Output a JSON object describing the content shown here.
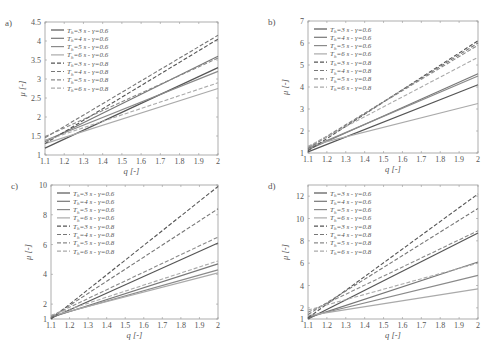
{
  "chart_data": [
    {
      "panel": "a)",
      "type": "line",
      "xlabel": "q [-]",
      "ylabel": "μ [-]",
      "xlim": [
        1.1,
        2
      ],
      "ylim": [
        1,
        4.5
      ],
      "xticks": [
        "1.1",
        "1.2",
        "1.3",
        "1.4",
        "1.5",
        "1.6",
        "1.7",
        "1.8",
        "1.9",
        "2"
      ],
      "yticks": [
        "1",
        "1.5",
        "2",
        "2.5",
        "3",
        "3.5",
        "4",
        "4.5"
      ],
      "legend_position": "upper left",
      "series": [
        {
          "name": "T_h=3 s - γ=0.6",
          "style": "solid",
          "color": "#555555",
          "x": [
            1.1,
            2
          ],
          "values": [
            1.18,
            3.3
          ]
        },
        {
          "name": "T_h=4 s - γ=0.6",
          "style": "solid",
          "color": "#777777",
          "x": [
            1.1,
            2
          ],
          "values": [
            1.35,
            3.6
          ]
        },
        {
          "name": "T_h=5 s - γ=0.6",
          "style": "solid",
          "color": "#8a8a8a",
          "x": [
            1.1,
            2
          ],
          "values": [
            1.38,
            3.2
          ]
        },
        {
          "name": "T_h=6 s - γ=0.6",
          "style": "solid",
          "color": "#aaaaaa",
          "x": [
            1.1,
            2
          ],
          "values": [
            1.3,
            2.75
          ]
        },
        {
          "name": "T_h=3 s - γ=0.8",
          "style": "dashed",
          "color": "#555555",
          "x": [
            1.1,
            2
          ],
          "values": [
            1.3,
            4.05
          ]
        },
        {
          "name": "T_h=4 s - γ=0.8",
          "style": "dashed",
          "color": "#777777",
          "x": [
            1.1,
            2
          ],
          "values": [
            1.45,
            4.15
          ]
        },
        {
          "name": "T_h=5 s - γ=0.8",
          "style": "dashed",
          "color": "#8a8a8a",
          "x": [
            1.1,
            2
          ],
          "values": [
            1.48,
            3.55
          ]
        },
        {
          "name": "T_h=6 s - γ=0.8",
          "style": "dashed",
          "color": "#aaaaaa",
          "x": [
            1.1,
            2
          ],
          "values": [
            1.38,
            2.9
          ]
        }
      ]
    },
    {
      "panel": "b)",
      "type": "line",
      "xlabel": "q [-]",
      "ylabel": "μ [-]",
      "xlim": [
        1.1,
        2
      ],
      "ylim": [
        1,
        7
      ],
      "xticks": [
        "1.1",
        "1.2",
        "1.3",
        "1.4",
        "1.5",
        "1.6",
        "1.7",
        "1.8",
        "1.9",
        "2"
      ],
      "yticks": [
        "1",
        "2",
        "3",
        "4",
        "5",
        "6",
        "7"
      ],
      "legend_position": "upper left",
      "series": [
        {
          "name": "T_h=3 s - γ=0.6",
          "style": "solid",
          "color": "#555555",
          "x": [
            1.1,
            2
          ],
          "values": [
            1.05,
            4.1
          ]
        },
        {
          "name": "T_h=4 s - γ=0.6",
          "style": "solid",
          "color": "#777777",
          "x": [
            1.1,
            2
          ],
          "values": [
            1.15,
            4.6
          ]
        },
        {
          "name": "T_h=5 s - γ=0.6",
          "style": "solid",
          "color": "#8a8a8a",
          "x": [
            1.1,
            2
          ],
          "values": [
            1.2,
            4.5
          ]
        },
        {
          "name": "T_h=6 s - γ=0.6",
          "style": "solid",
          "color": "#aaaaaa",
          "x": [
            1.1,
            2
          ],
          "values": [
            1.3,
            3.25
          ]
        },
        {
          "name": "T_h=3 s - γ=0.8",
          "style": "dashed",
          "color": "#555555",
          "x": [
            1.1,
            2
          ],
          "values": [
            1.1,
            6.1
          ]
        },
        {
          "name": "T_h=4 s - γ=0.8",
          "style": "dashed",
          "color": "#777777",
          "x": [
            1.1,
            2
          ],
          "values": [
            1.2,
            6.0
          ]
        },
        {
          "name": "T_h=5 s - γ=0.8",
          "style": "dashed",
          "color": "#8a8a8a",
          "x": [
            1.1,
            2
          ],
          "values": [
            1.25,
            5.9
          ]
        },
        {
          "name": "T_h=6 s - γ=0.8",
          "style": "dashed",
          "color": "#aaaaaa",
          "x": [
            1.1,
            2
          ],
          "values": [
            1.3,
            5.35
          ]
        }
      ]
    },
    {
      "panel": "c)",
      "type": "line",
      "xlabel": "q [-]",
      "ylabel": "μ [-]",
      "xlim": [
        1.1,
        2
      ],
      "ylim": [
        1,
        10
      ],
      "xticks": [
        "1.1",
        "1.2",
        "1.3",
        "1.4",
        "1.5",
        "1.6",
        "1.7",
        "1.8",
        "1.9",
        "2"
      ],
      "yticks": [
        "1",
        "2",
        "4",
        "6",
        "8",
        "10"
      ],
      "legend_position": "upper left",
      "series": [
        {
          "name": "T_h=3 s - γ=0.6",
          "style": "solid",
          "color": "#555555",
          "x": [
            1.1,
            2
          ],
          "values": [
            1.05,
            6.1
          ]
        },
        {
          "name": "T_h=4 s - γ=0.6",
          "style": "solid",
          "color": "#777777",
          "x": [
            1.1,
            2
          ],
          "values": [
            1.1,
            4.7
          ]
        },
        {
          "name": "T_h=5 s - γ=0.6",
          "style": "solid",
          "color": "#8a8a8a",
          "x": [
            1.1,
            2
          ],
          "values": [
            1.15,
            4.3
          ]
        },
        {
          "name": "T_h=6 s - γ=0.6",
          "style": "solid",
          "color": "#aaaaaa",
          "x": [
            1.1,
            2
          ],
          "values": [
            1.2,
            4.1
          ]
        },
        {
          "name": "T_h=3 s - γ=0.8",
          "style": "dashed",
          "color": "#555555",
          "x": [
            1.1,
            2
          ],
          "values": [
            1.0,
            9.9
          ]
        },
        {
          "name": "T_h=4 s - γ=0.8",
          "style": "dashed",
          "color": "#777777",
          "x": [
            1.1,
            2
          ],
          "values": [
            1.1,
            8.4
          ]
        },
        {
          "name": "T_h=5 s - γ=0.8",
          "style": "dashed",
          "color": "#8a8a8a",
          "x": [
            1.1,
            2
          ],
          "values": [
            1.2,
            6.5
          ]
        },
        {
          "name": "T_h=6 s - γ=0.8",
          "style": "dashed",
          "color": "#aaaaaa",
          "x": [
            1.1,
            2
          ],
          "values": [
            1.25,
            4.9
          ]
        }
      ]
    },
    {
      "panel": "d)",
      "type": "line",
      "xlabel": "q [-]",
      "ylabel": "μ [-]",
      "xlim": [
        1.1,
        2
      ],
      "ylim": [
        1,
        13
      ],
      "xticks": [
        "1.1",
        "1.2",
        "1.3",
        "1.4",
        "1.5",
        "1.6",
        "1.7",
        "1.8",
        "1.9",
        "2"
      ],
      "yticks": [
        "1",
        "2",
        "4",
        "6",
        "8",
        "10",
        "12"
      ],
      "legend_position": "upper left",
      "series": [
        {
          "name": "T_h=3 s - γ=0.6",
          "style": "solid",
          "color": "#555555",
          "x": [
            1.1,
            2
          ],
          "values": [
            1.0,
            8.7
          ]
        },
        {
          "name": "T_h=4 s - γ=0.6",
          "style": "solid",
          "color": "#777777",
          "x": [
            1.1,
            2
          ],
          "values": [
            1.1,
            6.1
          ]
        },
        {
          "name": "T_h=5 s - γ=0.6",
          "style": "solid",
          "color": "#8a8a8a",
          "x": [
            1.1,
            2
          ],
          "values": [
            1.2,
            4.9
          ]
        },
        {
          "name": "T_h=6 s - γ=0.6",
          "style": "solid",
          "color": "#aaaaaa",
          "x": [
            1.1,
            2
          ],
          "values": [
            1.3,
            3.7
          ]
        },
        {
          "name": "T_h=3 s - γ=0.8",
          "style": "dashed",
          "color": "#555555",
          "x": [
            1.1,
            2
          ],
          "values": [
            1.1,
            12.2
          ]
        },
        {
          "name": "T_h=4 s - γ=0.8",
          "style": "dashed",
          "color": "#777777",
          "x": [
            1.1,
            2
          ],
          "values": [
            1.4,
            10.9
          ]
        },
        {
          "name": "T_h=5 s - γ=0.8",
          "style": "dashed",
          "color": "#8a8a8a",
          "x": [
            1.1,
            2
          ],
          "values": [
            1.6,
            8.9
          ]
        },
        {
          "name": "T_h=6 s - γ=0.8",
          "style": "dashed",
          "color": "#aaaaaa",
          "x": [
            1.1,
            2
          ],
          "values": [
            1.8,
            6.0
          ]
        }
      ]
    }
  ]
}
